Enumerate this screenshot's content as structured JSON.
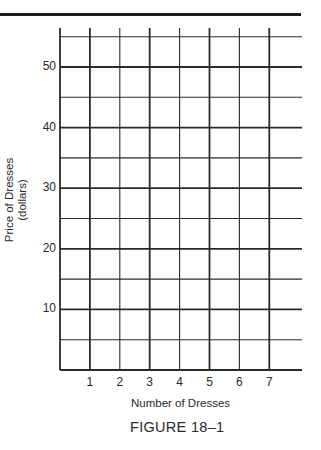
{
  "chart_data": {
    "type": "line",
    "title": "",
    "caption": "FIGURE 18–1",
    "xlabel": "Number of Dresses",
    "ylabel": "Price of Dresses",
    "ylabel_unit": "(dollars)",
    "x_ticks": [
      "1",
      "2",
      "3",
      "4",
      "5",
      "6",
      "7"
    ],
    "y_ticks": [
      "10",
      "20",
      "30",
      "40",
      "50"
    ],
    "xlim": [
      0,
      8
    ],
    "ylim": [
      0,
      55
    ],
    "grid": true,
    "grid_minor_y_step": 5,
    "grid_x_step": 1,
    "series": [],
    "note": "Blank graph grid for plotting; no data plotted"
  },
  "colors": {
    "grid": "#2b2b2b",
    "text": "#2a2a2a",
    "rule": "#1e1e1e"
  }
}
